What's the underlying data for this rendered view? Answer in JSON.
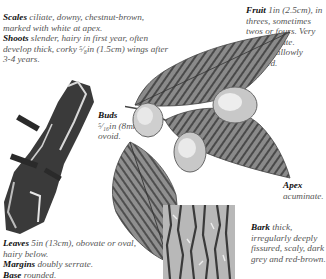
{
  "notes": {
    "scales": {
      "term": "Scales",
      "text": " ciliate, downy, chestnut-brown, marked with white at apex."
    },
    "shoots": {
      "term": "Shoots",
      "text": " slender, hairy in first year, often develop thick, corky ⁵⁄₈in (1.5cm) wings after 3-4 years."
    },
    "fruit": {
      "term": "Fruit",
      "text": " 1in (2.5cm), in threes, sometimes twos or fours. Very hairy, ciliate."
    },
    "fruit_apex": {
      "term": "Apex",
      "text": " shallowly notched."
    },
    "buds": {
      "term": "Buds",
      "text": "⁵⁄₁₆in (8mm), ovoid."
    },
    "leaves": {
      "term": "Leaves",
      "text": " 5in (13cm), obovate or oval, hairy below."
    },
    "margins": {
      "term": "Margins",
      "text": " doubly serrate."
    },
    "base": {
      "term": "Base",
      "text": " rounded."
    },
    "leaf_apex": {
      "term": "Apex",
      "text": "acuminate."
    },
    "bark": {
      "term": "Bark",
      "text": " thick, irregularly deeply fissured, scaly, dark grey and red-brown."
    }
  },
  "illustrations": {
    "corky_shoot": "corky winged shoot",
    "fruiting_branch": "leaves with fruit clusters",
    "single_leaf": "single leaf",
    "bark_sample": "bark texture"
  }
}
